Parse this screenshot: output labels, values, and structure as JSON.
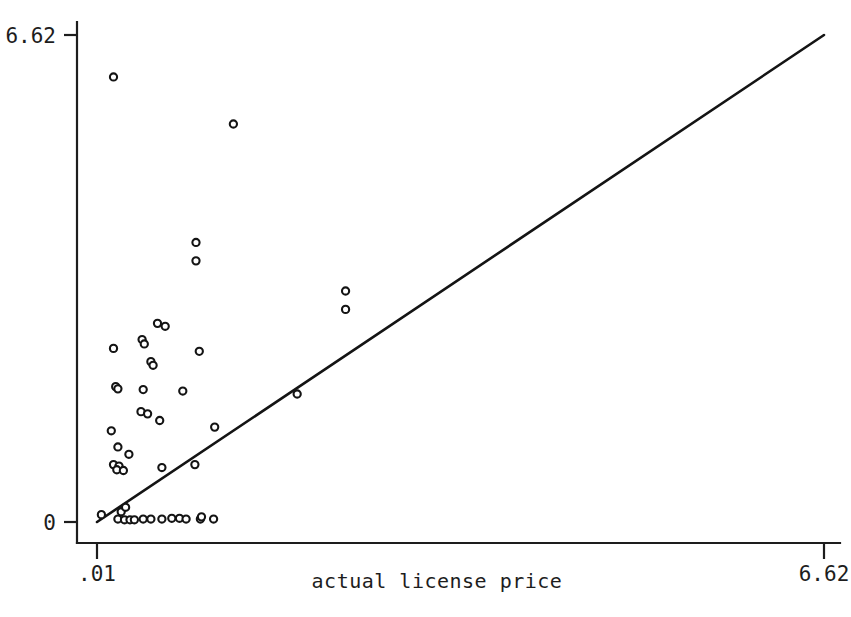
{
  "chart_data": {
    "type": "scatter",
    "title": "",
    "subtitle": "",
    "xlabel": "actual license price",
    "ylabel": "",
    "xlim": [
      0.01,
      6.62
    ],
    "ylim": [
      0,
      6.62
    ],
    "grid": false,
    "legend": null,
    "x_ticks": [
      {
        "value": 0.01,
        "label": ".01"
      },
      {
        "value": 6.62,
        "label": "6.62"
      }
    ],
    "y_ticks": [
      {
        "value": 0,
        "label": "0"
      },
      {
        "value": 6.62,
        "label": "6.62"
      }
    ],
    "annotations": [
      {
        "name": "forty-five-degree-reference-line",
        "type": "line",
        "x0": 0.01,
        "y0": 0.0,
        "x1": 6.62,
        "y1": 6.62
      }
    ],
    "marker_style": "open-circle",
    "series": [
      {
        "name": "predicted vs actual license price",
        "points": [
          [
            0.16,
            6.05
          ],
          [
            1.25,
            5.41
          ],
          [
            0.91,
            3.8
          ],
          [
            0.91,
            3.55
          ],
          [
            2.27,
            3.14
          ],
          [
            2.27,
            2.89
          ],
          [
            0.56,
            2.7
          ],
          [
            0.63,
            2.66
          ],
          [
            0.42,
            2.48
          ],
          [
            0.44,
            2.42
          ],
          [
            0.16,
            2.36
          ],
          [
            0.94,
            2.32
          ],
          [
            0.5,
            2.18
          ],
          [
            0.52,
            2.13
          ],
          [
            0.18,
            1.84
          ],
          [
            0.2,
            1.81
          ],
          [
            0.43,
            1.8
          ],
          [
            0.79,
            1.78
          ],
          [
            1.83,
            1.74
          ],
          [
            0.41,
            1.5
          ],
          [
            0.47,
            1.47
          ],
          [
            0.58,
            1.38
          ],
          [
            1.08,
            1.29
          ],
          [
            0.14,
            1.24
          ],
          [
            0.2,
            1.02
          ],
          [
            0.3,
            0.92
          ],
          [
            0.16,
            0.78
          ],
          [
            0.21,
            0.76
          ],
          [
            0.19,
            0.71
          ],
          [
            0.25,
            0.7
          ],
          [
            0.6,
            0.74
          ],
          [
            0.9,
            0.78
          ],
          [
            0.05,
            0.1
          ],
          [
            0.23,
            0.14
          ],
          [
            0.27,
            0.2
          ],
          [
            0.2,
            0.04
          ],
          [
            0.26,
            0.03
          ],
          [
            0.31,
            0.03
          ],
          [
            0.35,
            0.03
          ],
          [
            0.43,
            0.04
          ],
          [
            0.5,
            0.04
          ],
          [
            0.6,
            0.04
          ],
          [
            0.69,
            0.05
          ],
          [
            0.76,
            0.05
          ],
          [
            0.82,
            0.04
          ],
          [
            0.95,
            0.04
          ],
          [
            0.96,
            0.07
          ],
          [
            1.07,
            0.04
          ]
        ]
      }
    ]
  },
  "axis_labels": {
    "y_top": "6.62",
    "y_bottom": "0",
    "x_left": ".01",
    "x_right": "6.62",
    "x_title": "actual license price"
  },
  "colors": {
    "ink": "#1d1d1d",
    "background": "#ffffff",
    "marker_stroke": "#141414",
    "marker_fill": "#ffffff",
    "reference_line": "#141414"
  }
}
